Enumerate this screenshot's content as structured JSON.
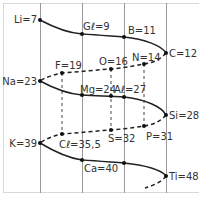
{
  "diagram": {
    "type": "telluric-screw-helix",
    "colors": {
      "line": "#222222",
      "grid": "#999999",
      "frame": "#d8d8d8",
      "text": "#333333"
    },
    "elements": [
      {
        "id": "li",
        "label": "Li=7"
      },
      {
        "id": "gl",
        "label": "Gℓ=9"
      },
      {
        "id": "b",
        "label": "B=11"
      },
      {
        "id": "c",
        "label": "C=12"
      },
      {
        "id": "n",
        "label": "N=14"
      },
      {
        "id": "o",
        "label": "O=16"
      },
      {
        "id": "f",
        "label": "F=19"
      },
      {
        "id": "na",
        "label": "Na=23"
      },
      {
        "id": "mg",
        "label": "Mg=24"
      },
      {
        "id": "al",
        "label": "Aℓ=27"
      },
      {
        "id": "si",
        "label": "Si=28"
      },
      {
        "id": "p",
        "label": "P=31"
      },
      {
        "id": "s",
        "label": "S=32"
      },
      {
        "id": "cl",
        "label": "Cℓ=35,5"
      },
      {
        "id": "k",
        "label": "K=39"
      },
      {
        "id": "ca",
        "label": "Ca=40"
      },
      {
        "id": "ti",
        "label": "Ti=48"
      }
    ]
  }
}
